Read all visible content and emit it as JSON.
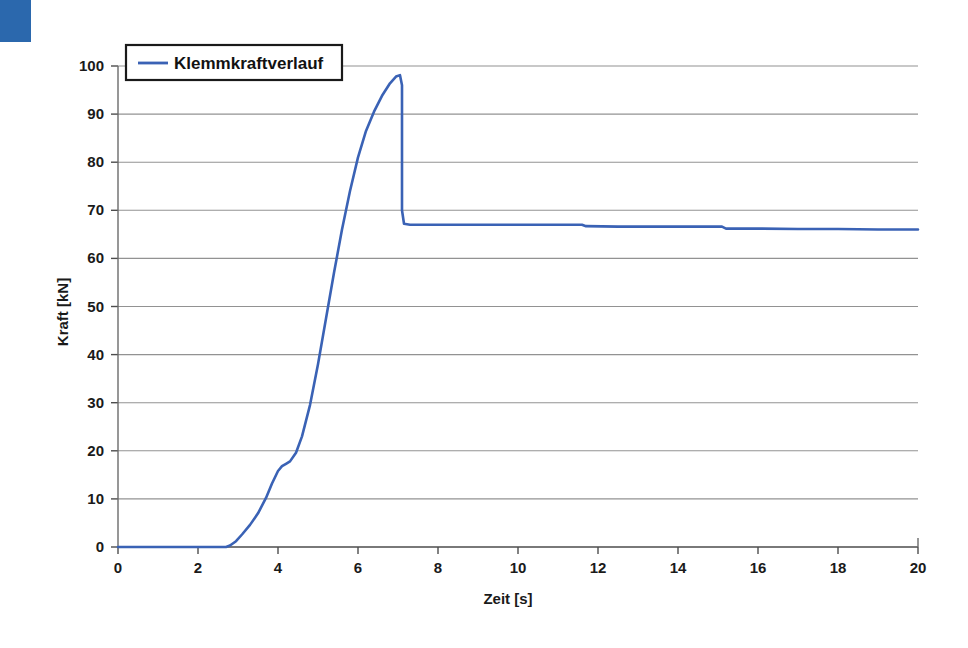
{
  "figure": {
    "background_color": "#ffffff",
    "scan_artifact": {
      "name": "blue-corner-block",
      "color": "#2b68ad"
    }
  },
  "chart_data": {
    "type": "line",
    "title": "",
    "xlabel": "Zeit [s]",
    "ylabel": "Kraft [kN]",
    "xlim": [
      0,
      20
    ],
    "ylim": [
      0,
      100
    ],
    "xticks": [
      0,
      2,
      4,
      6,
      8,
      10,
      12,
      14,
      16,
      18,
      20
    ],
    "yticks": [
      0,
      10,
      20,
      30,
      40,
      50,
      60,
      70,
      80,
      90,
      100
    ],
    "xtick_labels": [
      "0",
      "2",
      "4",
      "6",
      "8",
      "10",
      "12",
      "14",
      "16",
      "18",
      "20"
    ],
    "ytick_labels": [
      "0",
      "10",
      "20",
      "30",
      "40",
      "50",
      "60",
      "70",
      "80",
      "90",
      "100"
    ],
    "grid": {
      "horizontal": true,
      "vertical": false,
      "color": "#808080"
    },
    "legend": {
      "position": "top-left-inside",
      "entries": [
        {
          "name": "Klemmkraftverlauf",
          "color": "#3a62b5"
        }
      ]
    },
    "series": [
      {
        "name": "Klemmkraftverlauf",
        "color": "#3a62b5",
        "line_width": 2.6,
        "x": [
          0.0,
          0.5,
          1.0,
          1.5,
          2.0,
          2.4,
          2.7,
          2.8,
          2.95,
          3.1,
          3.3,
          3.5,
          3.7,
          3.85,
          4.0,
          4.1,
          4.2,
          4.3,
          4.45,
          4.6,
          4.8,
          5.0,
          5.2,
          5.4,
          5.6,
          5.8,
          6.0,
          6.2,
          6.4,
          6.6,
          6.8,
          6.95,
          7.05,
          7.1,
          7.1,
          7.15,
          7.3,
          8.0,
          9.0,
          10.0,
          11.0,
          11.6,
          11.7,
          12.5,
          13.5,
          14.5,
          15.1,
          15.2,
          16.0,
          17.0,
          18.0,
          19.0,
          20.0
        ],
        "y": [
          0.0,
          0.0,
          0.0,
          0.0,
          0.0,
          0.0,
          0.0,
          0.3,
          1.2,
          2.6,
          4.6,
          7.0,
          10.2,
          13.2,
          15.8,
          16.8,
          17.3,
          17.8,
          19.6,
          23.0,
          29.5,
          38.0,
          47.5,
          57.0,
          66.0,
          74.0,
          81.0,
          86.5,
          90.5,
          93.8,
          96.4,
          97.8,
          98.1,
          96.0,
          70.0,
          67.2,
          67.0,
          67.0,
          67.0,
          67.0,
          67.0,
          67.0,
          66.7,
          66.6,
          66.6,
          66.6,
          66.6,
          66.2,
          66.2,
          66.1,
          66.1,
          66.0,
          66.0
        ],
        "annotations": {
          "peak_value": 98.1,
          "peak_time": 7.05,
          "plateau_value": 67.0,
          "end_value": 66.0,
          "rise_start_time": 2.75
        }
      }
    ]
  }
}
